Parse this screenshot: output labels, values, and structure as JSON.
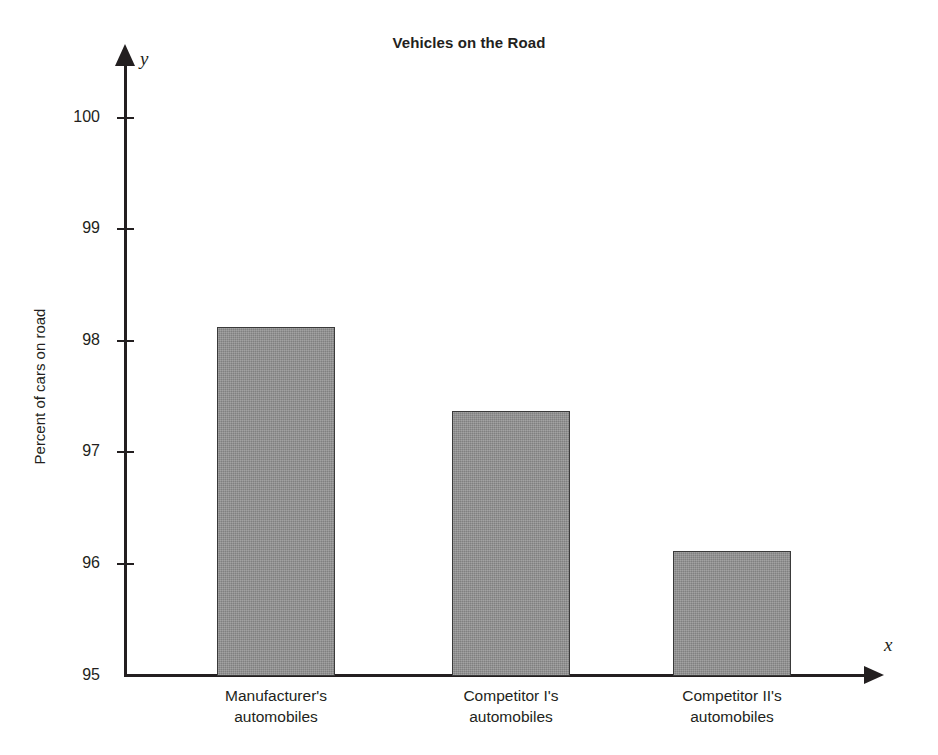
{
  "chart_data": {
    "type": "bar",
    "title": "Vehicles on the Road",
    "xlabel": "",
    "ylabel": "Percent of cars on road",
    "categories": [
      "Manufacturer's automobiles",
      "Competitor I's automobiles",
      "Competitor II's automobiles"
    ],
    "category_lines": [
      [
        "Manufacturer's",
        "automobiles"
      ],
      [
        "Competitor I's",
        "automobiles"
      ],
      [
        "Competitor II's",
        "automobiles"
      ]
    ],
    "values": [
      98.12,
      97.37,
      96.12
    ],
    "ylim": [
      95,
      100
    ],
    "y_ticks": [
      95,
      96,
      97,
      98,
      99,
      100
    ],
    "y_tick_labels": [
      "95",
      "96",
      "97",
      "98",
      "99",
      "100"
    ],
    "grid": false,
    "legend": "none",
    "axis_letters": {
      "x": "x",
      "y": "y"
    },
    "bar_color": "#8c8c8c",
    "bar_border_color": "#3a3a3a",
    "axis_color": "#231f20"
  }
}
